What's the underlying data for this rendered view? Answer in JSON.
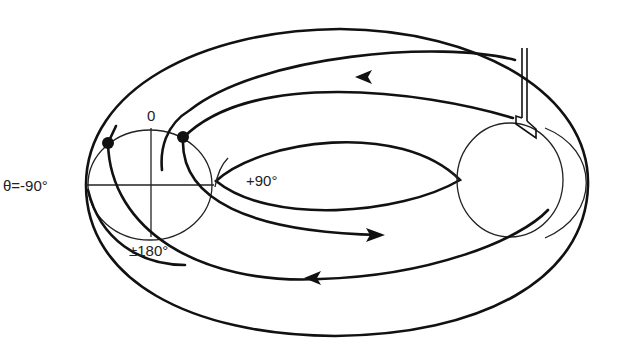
{
  "diagram": {
    "type": "toroidal field-line trajectory with poloidal angle markers",
    "labels": {
      "theta_minus_90": "θ=-90°",
      "theta_zero": "0",
      "theta_plus_90": "+90°",
      "theta_180": "±180°"
    },
    "elements": {
      "torus_outer_boundary": "outer ellipse of the torus",
      "torus_inner_hole": "inner lens-shaped hole",
      "poloidal_cross_section_left": "thin circle with cross-hair axes at left side",
      "poloidal_cross_section_right": "thin circle at right side",
      "probe": "double-line probe entering from top right",
      "markers": 2,
      "arrows": 3
    },
    "colors": {
      "line": "#111111",
      "background": "#ffffff"
    }
  }
}
